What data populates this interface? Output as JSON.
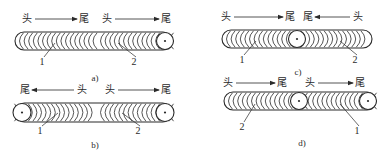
{
  "figure": {
    "panels": [
      {
        "id": "a",
        "caption": "a)",
        "bead": {
          "x1": 15,
          "x2": 172,
          "y1": 32,
          "y2": 50
        },
        "junction_x": 96,
        "craters": [
          165
        ],
        "segments": [
          {
            "from_label": "头",
            "to_label": "尾",
            "from_x": 27,
            "to_x": 84,
            "dir": "right",
            "ripple": "left",
            "x1": 15,
            "x2": 96
          },
          {
            "from_label": "头",
            "to_label": "尾",
            "from_x": 107,
            "to_x": 166,
            "dir": "right",
            "ripple": "left",
            "x1": 96,
            "x2": 172
          }
        ],
        "label_y": 19,
        "leaders": [
          {
            "text": "1",
            "tx": 42,
            "ty": 62,
            "px": 55,
            "py": 43
          },
          {
            "text": "2",
            "tx": 134,
            "ty": 62,
            "px": 118,
            "py": 43
          }
        ],
        "caption_pos": {
          "x": 95,
          "y": 78
        }
      },
      {
        "id": "b",
        "caption": "b)",
        "bead": {
          "x1": 15,
          "x2": 172,
          "y1": 103,
          "y2": 122
        },
        "junction_x": 96,
        "craters": [
          22,
          165
        ],
        "segments": [
          {
            "from_label": "头",
            "to_label": "尾",
            "from_x": 82,
            "to_x": 25,
            "dir": "left",
            "ripple": "right",
            "x1": 15,
            "x2": 96
          },
          {
            "from_label": "头",
            "to_label": "尾",
            "from_x": 110,
            "to_x": 166,
            "dir": "right",
            "ripple": "left",
            "x1": 96,
            "x2": 172
          }
        ],
        "label_y": 90,
        "leaders": [
          {
            "text": "1",
            "tx": 40,
            "ty": 131,
            "px": 58,
            "py": 113
          },
          {
            "text": "2",
            "tx": 138,
            "ty": 131,
            "px": 122,
            "py": 113
          }
        ],
        "caption_pos": {
          "x": 95,
          "y": 145
        }
      },
      {
        "id": "c",
        "caption": "c)",
        "bead": {
          "x1": 222,
          "x2": 372,
          "y1": 30,
          "y2": 48
        },
        "junction_x": 297,
        "craters": [
          297
        ],
        "segments": [
          {
            "from_label": "头",
            "to_label": "尾",
            "from_x": 226,
            "to_x": 290,
            "dir": "right",
            "ripple": "left",
            "x1": 222,
            "x2": 297
          },
          {
            "from_label": "头",
            "to_label": "尾",
            "from_x": 358,
            "to_x": 308,
            "dir": "left",
            "ripple": "right",
            "x1": 297,
            "x2": 372
          }
        ],
        "label_y": 17,
        "leaders": [
          {
            "text": "1",
            "tx": 242,
            "ty": 60,
            "px": 256,
            "py": 41
          },
          {
            "text": "2",
            "tx": 355,
            "ty": 60,
            "px": 340,
            "py": 41
          }
        ],
        "caption_pos": {
          "x": 298,
          "y": 72
        }
      },
      {
        "id": "d",
        "caption": "d)",
        "bead": {
          "x1": 224,
          "x2": 376,
          "y1": 92,
          "y2": 110
        },
        "junction_x": 299,
        "craters": [
          299,
          368
        ],
        "segments": [
          {
            "from_label": "头",
            "to_label": "尾",
            "from_x": 228,
            "to_x": 282,
            "dir": "right",
            "ripple": "left",
            "x1": 224,
            "x2": 299
          },
          {
            "from_label": "头",
            "to_label": "尾",
            "from_x": 310,
            "to_x": 360,
            "dir": "right",
            "ripple": "left",
            "x1": 299,
            "x2": 376
          }
        ],
        "label_y": 83,
        "leaders": [
          {
            "text": "2",
            "tx": 242,
            "ty": 127,
            "px": 255,
            "py": 104
          },
          {
            "text": "1",
            "tx": 357,
            "ty": 131,
            "px": 340,
            "py": 104
          }
        ],
        "caption_pos": {
          "x": 302,
          "y": 143
        }
      }
    ]
  },
  "colors": {
    "ink": "#2a2a2a",
    "background": "#ffffff"
  }
}
